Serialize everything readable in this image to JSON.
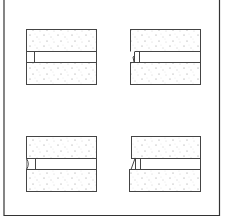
{
  "figure": {
    "frame_color": "#333333",
    "block_stroke": "#444444",
    "stipple_color": "#777777",
    "panels": [
      {
        "id": "top-left",
        "edge_style": "straight"
      },
      {
        "id": "top-right",
        "edge_style": "jogged"
      },
      {
        "id": "bottom-left",
        "edge_style": "curved"
      },
      {
        "id": "bottom-right",
        "edge_style": "slanted"
      }
    ]
  }
}
